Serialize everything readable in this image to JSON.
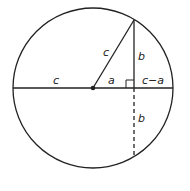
{
  "diagram": {
    "colors": {
      "stroke": "#222222",
      "background": "#ffffff"
    },
    "labels": {
      "left_radius": "c",
      "slant_radius": "c",
      "upper_half_chord": "b",
      "center_to_foot": "a",
      "foot_to_edge": "c−a",
      "lower_half_chord": "b"
    }
  }
}
